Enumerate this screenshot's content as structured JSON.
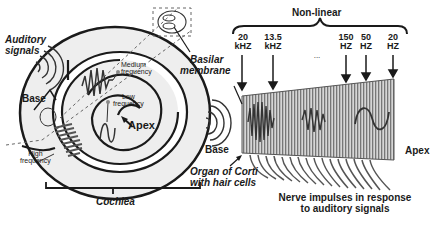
{
  "left_panel": {
    "auditory_signals": [
      "Auditory",
      "signals"
    ],
    "base": "Base",
    "medium_frequency": [
      "Medium",
      "frequency"
    ],
    "low_frequency": [
      "Low",
      "frequency"
    ],
    "apex": "Apex",
    "high_frequency": [
      "High",
      "frequency"
    ],
    "basilar_membrane": [
      "Basilar",
      "membrane"
    ],
    "cochlea": "Cochlea"
  },
  "right_panel": {
    "non_linear": "Non-linear",
    "frequency_markers": [
      {
        "value": "20",
        "unit": "kHZ"
      },
      {
        "value": "13.5",
        "unit": "kHZ"
      },
      {
        "value": "...",
        "unit": ""
      },
      {
        "value": "150",
        "unit": "HZ"
      },
      {
        "value": "50",
        "unit": "HZ"
      },
      {
        "value": "20",
        "unit": "HZ"
      }
    ],
    "base": "Base",
    "apex": "Apex",
    "organ_of_corti": [
      "Organ of Corti",
      "with hair cells"
    ],
    "nerve_impulses": [
      "Nerve impulses in response",
      "to auditory signals"
    ]
  },
  "colors": {
    "line": "#1a1a1a",
    "cochlea_fill": "#eeeeee",
    "membrane_stripe": "#888888",
    "membrane_bg": "#cfcfcf"
  }
}
